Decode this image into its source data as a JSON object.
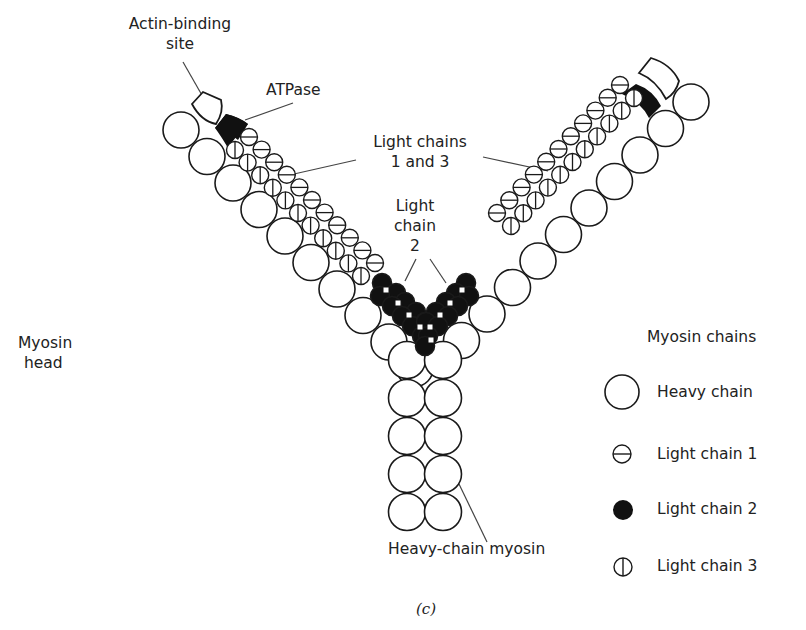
{
  "labels": {
    "actin_binding_site": [
      "Actin-binding",
      "site"
    ],
    "atpase": "ATPase",
    "light_chains_1_3": [
      "Light chains",
      "1 and 3"
    ],
    "light_chain_2": [
      "Light",
      "chain",
      "2"
    ],
    "myosin_head": [
      "Myosin",
      "head"
    ],
    "heavy_chain_myosin": "Heavy-chain myosin",
    "caption": "(c)"
  },
  "legend": {
    "title": "Myosin chains",
    "items": [
      {
        "symbol": "heavy-chain",
        "label": "Heavy chain"
      },
      {
        "symbol": "light-chain-1",
        "label": "Light chain 1"
      },
      {
        "symbol": "light-chain-2",
        "label": "Light chain 2"
      },
      {
        "symbol": "light-chain-3",
        "label": "Light chain 3"
      }
    ]
  },
  "colors": {
    "stroke": "#1a1a1a",
    "fill_heavy": "#ffffff",
    "fill_light2": "#111111",
    "leader_line": "#444444"
  },
  "structure": {
    "heavy_chain_left_arm": {
      "count": 10,
      "start": [
        181,
        130
      ],
      "step": [
        26,
        26.5
      ],
      "r": 18
    },
    "heavy_chain_right_arm": {
      "count": 10,
      "start": [
        691,
        102
      ],
      "step": [
        -25.5,
        26.5
      ],
      "r": 18
    },
    "heavy_chain_stem": {
      "columns_x": [
        407,
        443
      ],
      "rows_y": [
        360,
        398,
        436,
        474,
        512
      ],
      "r": 18.5
    },
    "light_chain_1_left": {
      "count": 11,
      "start": [
        249,
        137
      ],
      "step": [
        12.6,
        12.6
      ],
      "r": 8.5
    },
    "light_chain_3_left": {
      "count": 11,
      "start": [
        235,
        150
      ],
      "step": [
        12.6,
        12.6
      ],
      "r": 8.5
    },
    "light_chain_1_right": {
      "count": 11,
      "start": [
        620,
        85
      ],
      "step": [
        -12.3,
        12.8
      ],
      "r": 8.5
    },
    "light_chain_3_right": {
      "count": 11,
      "start": [
        634,
        98
      ],
      "step": [
        -12.3,
        12.8
      ],
      "r": 8.5
    }
  }
}
